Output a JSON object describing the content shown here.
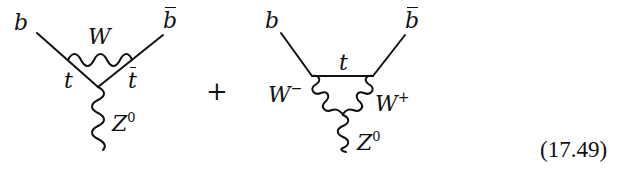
{
  "equation": {
    "number": "(17.49)",
    "operator": "+"
  },
  "diagrams": [
    {
      "id": "triangle-w-exchange",
      "external_left": "b",
      "external_right": "b",
      "external_right_bar": true,
      "loop_boson": "W",
      "internal_left": "t",
      "internal_right": "t",
      "internal_right_bar": true,
      "outgoing_boson": "Z",
      "outgoing_boson_sup": "0"
    },
    {
      "id": "triangle-top-exchange",
      "external_left": "b",
      "external_right": "b",
      "external_right_bar": true,
      "internal_fermion": "t",
      "boson_left": "W",
      "boson_left_sup": "−",
      "boson_right": "W",
      "boson_right_sup": "+",
      "outgoing_boson": "Z",
      "outgoing_boson_sup": "0"
    }
  ]
}
